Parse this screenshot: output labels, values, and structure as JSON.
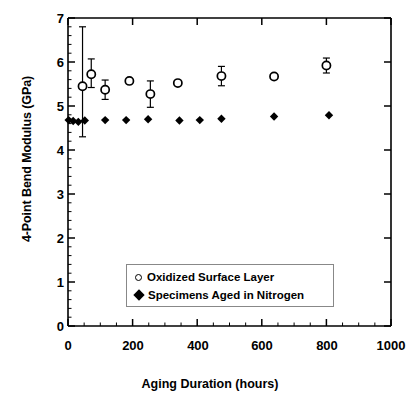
{
  "chart_data": {
    "type": "scatter",
    "title": "",
    "xlabel": "Aging Duration (hours)",
    "ylabel": "4-Point Bend Modulus (GPa)",
    "xlim": [
      0,
      1000
    ],
    "ylim": [
      0,
      7
    ],
    "xticks": [
      0,
      200,
      400,
      600,
      800,
      1000
    ],
    "yticks": [
      0,
      1,
      2,
      3,
      4,
      5,
      6,
      7
    ],
    "xtick_labels": [
      "0",
      "200",
      "400",
      "600",
      "800",
      "1000"
    ],
    "ytick_labels": [
      "0",
      "1",
      "2",
      "3",
      "4",
      "5",
      "6",
      "7"
    ],
    "minor_ticks": true,
    "grid": false,
    "legend_position": "lower-center",
    "series": [
      {
        "name": "Oxidized Surface Layer",
        "marker": "open-circle",
        "color": "#000000",
        "points": [
          {
            "x": 45,
            "y": 5.45,
            "yerr_low": 1.15,
            "yerr_high": 1.35
          },
          {
            "x": 72,
            "y": 5.72,
            "yerr_low": 0.3,
            "yerr_high": 0.35
          },
          {
            "x": 115,
            "y": 5.37,
            "yerr_low": 0.22,
            "yerr_high": 0.22
          },
          {
            "x": 190,
            "y": 5.57,
            "yerr_low": 0.0,
            "yerr_high": 0.0
          },
          {
            "x": 255,
            "y": 5.27,
            "yerr_low": 0.3,
            "yerr_high": 0.3
          },
          {
            "x": 340,
            "y": 5.52,
            "yerr_low": 0.0,
            "yerr_high": 0.0
          },
          {
            "x": 475,
            "y": 5.68,
            "yerr_low": 0.22,
            "yerr_high": 0.22
          },
          {
            "x": 638,
            "y": 5.67,
            "yerr_low": 0.0,
            "yerr_high": 0.0
          },
          {
            "x": 800,
            "y": 5.92,
            "yerr_low": 0.17,
            "yerr_high": 0.17
          }
        ]
      },
      {
        "name": "Specimens Aged in Nitrogen",
        "marker": "filled-diamond",
        "color": "#000000",
        "points": [
          {
            "x": 2,
            "y": 4.68
          },
          {
            "x": 16,
            "y": 4.66
          },
          {
            "x": 32,
            "y": 4.64
          },
          {
            "x": 52,
            "y": 4.67
          },
          {
            "x": 115,
            "y": 4.68
          },
          {
            "x": 180,
            "y": 4.68
          },
          {
            "x": 248,
            "y": 4.7
          },
          {
            "x": 345,
            "y": 4.67
          },
          {
            "x": 408,
            "y": 4.68
          },
          {
            "x": 475,
            "y": 4.71
          },
          {
            "x": 638,
            "y": 4.76
          },
          {
            "x": 808,
            "y": 4.79
          }
        ]
      }
    ]
  },
  "legend": {
    "items": [
      {
        "label": "Oxidized Surface Layer",
        "marker": "open-circle"
      },
      {
        "label": "Specimens Aged in Nitrogen",
        "marker": "filled-diamond"
      }
    ]
  },
  "axes": {
    "x_title": "Aging Duration (hours)",
    "y_title": "4-Point Bend Modulus (GPa)",
    "y": {
      "t0": "0",
      "t1": "1",
      "t2": "2",
      "t3": "3",
      "t4": "4",
      "t5": "5",
      "t6": "6",
      "t7": "7"
    },
    "x": {
      "t0": "0",
      "t200": "200",
      "t400": "400",
      "t600": "600",
      "t800": "800",
      "t1000": "1000"
    }
  }
}
